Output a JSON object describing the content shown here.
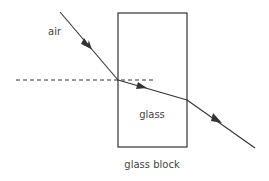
{
  "diagram": {
    "title": "glass block",
    "labels": {
      "air": "air",
      "glass": "glass",
      "caption": "glass block"
    },
    "elements": {
      "block": {
        "x": 118,
        "y": 13,
        "width": 69,
        "height": 134
      },
      "normal": {
        "x1": 16,
        "y1": 80,
        "x2": 153,
        "y2": 80,
        "style": "dashed"
      },
      "incident_ray": {
        "x1": 60,
        "y1": 12,
        "x2": 118,
        "y2": 80
      },
      "refracted_ray": {
        "x1": 118,
        "y1": 80,
        "x2": 187,
        "y2": 100
      },
      "emergent_ray": {
        "x1": 187,
        "y1": 100,
        "x2": 255,
        "y2": 148
      }
    },
    "colors": {
      "line": "#333333",
      "text": "#444444"
    }
  }
}
